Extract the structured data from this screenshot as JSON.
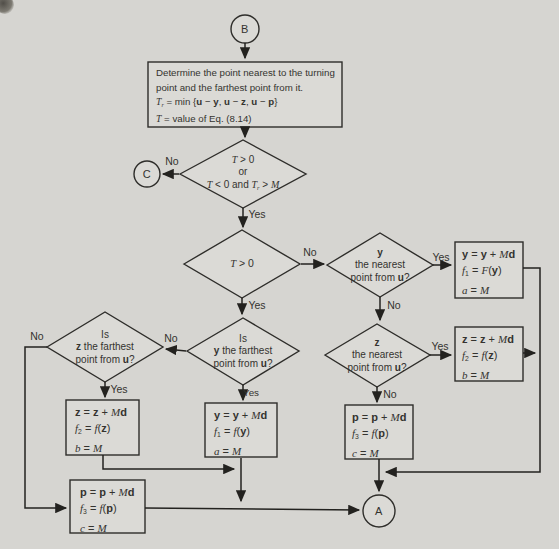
{
  "diagram": {
    "terminals": {
      "b": "B",
      "c": "C",
      "a": "A"
    },
    "labels": {
      "yes": "Yes",
      "no": "No"
    },
    "process": {
      "l1": "Determine the point nearest to the turning",
      "l2": "point and the farthest point from it.",
      "l3": [
        {
          "t": "T",
          "i": true
        },
        {
          "t": "r",
          "i": true,
          "sub": true
        },
        {
          "t": " = min {"
        },
        {
          "t": "u",
          "b": true
        },
        {
          "t": " − "
        },
        {
          "t": "y",
          "b": true
        },
        {
          "t": ", "
        },
        {
          "t": "u",
          "b": true
        },
        {
          "t": " − "
        },
        {
          "t": "z",
          "b": true
        },
        {
          "t": ", "
        },
        {
          "t": "u",
          "b": true
        },
        {
          "t": " − "
        },
        {
          "t": "p",
          "b": true
        },
        {
          "t": "}"
        }
      ],
      "l4": [
        {
          "t": "T",
          "i": true
        },
        {
          "t": " = value of Eq. (8.14)"
        }
      ]
    },
    "decisions": {
      "d1": {
        "l1": [
          {
            "t": "T",
            "i": true
          },
          {
            "t": " > 0"
          }
        ],
        "l2": "or",
        "l3": [
          {
            "t": "T",
            "i": true
          },
          {
            "t": " < 0 and "
          },
          {
            "t": "T",
            "i": true
          },
          {
            "t": "r",
            "i": true,
            "sub": true
          },
          {
            "t": " > "
          },
          {
            "t": "M",
            "i": true
          }
        ]
      },
      "d2": {
        "l1": [
          {
            "t": "T",
            "i": true
          },
          {
            "t": " > 0"
          }
        ]
      },
      "d3": {
        "l1": [
          {
            "t": "y",
            "b": true
          }
        ],
        "l2": "the nearest",
        "l3": [
          {
            "t": "point from "
          },
          {
            "t": "u",
            "b": true
          },
          {
            "t": "?"
          }
        ]
      },
      "d5": {
        "l1": [
          {
            "t": "z",
            "b": true
          }
        ],
        "l2": "the nearest",
        "l3": [
          {
            "t": "point from "
          },
          {
            "t": "u",
            "b": true
          },
          {
            "t": "?"
          }
        ]
      },
      "d4": {
        "l1": "Is",
        "l2": [
          {
            "t": "y",
            "b": true
          },
          {
            "t": " the farthest"
          }
        ],
        "l3": [
          {
            "t": "point from "
          },
          {
            "t": "u",
            "b": true
          },
          {
            "t": "?"
          }
        ]
      },
      "d6": {
        "l1": "Is",
        "l2": [
          {
            "t": "z",
            "b": true
          },
          {
            "t": " the farthest"
          }
        ],
        "l3": [
          {
            "t": "point from "
          },
          {
            "t": "u",
            "b": true
          },
          {
            "t": "?"
          }
        ]
      }
    },
    "boxes": {
      "y_right": {
        "l1": [
          {
            "t": "y",
            "b": true
          },
          {
            "t": " = "
          },
          {
            "t": "y",
            "b": true
          },
          {
            "t": " + "
          },
          {
            "t": "M",
            "i": true
          },
          {
            "t": "d",
            "b": true
          }
        ],
        "l2": [
          {
            "t": "f",
            "i": true
          },
          {
            "t": "1",
            "sub": true
          },
          {
            "t": " = "
          },
          {
            "t": "F",
            "i": true
          },
          {
            "t": "("
          },
          {
            "t": "y",
            "b": true
          },
          {
            "t": ")"
          }
        ],
        "l3": [
          {
            "t": "a",
            "i": true
          },
          {
            "t": " = "
          },
          {
            "t": "M",
            "i": true
          }
        ]
      },
      "z_right": {
        "l1": [
          {
            "t": "z",
            "b": true
          },
          {
            "t": " = "
          },
          {
            "t": "z",
            "b": true
          },
          {
            "t": " + "
          },
          {
            "t": "M",
            "i": true
          },
          {
            "t": "d",
            "b": true
          }
        ],
        "l2": [
          {
            "t": "f",
            "i": true
          },
          {
            "t": "2",
            "sub": true
          },
          {
            "t": " = "
          },
          {
            "t": "f",
            "i": true
          },
          {
            "t": "("
          },
          {
            "t": "z",
            "b": true
          },
          {
            "t": ")"
          }
        ],
        "l3": [
          {
            "t": "b",
            "i": true
          },
          {
            "t": " = "
          },
          {
            "t": "M",
            "i": true
          }
        ]
      },
      "p_right": {
        "l1": [
          {
            "t": "p",
            "b": true
          },
          {
            "t": " = "
          },
          {
            "t": "p",
            "b": true
          },
          {
            "t": " + "
          },
          {
            "t": "M",
            "i": true
          },
          {
            "t": "d",
            "b": true
          }
        ],
        "l2": [
          {
            "t": "f",
            "i": true
          },
          {
            "t": "3",
            "sub": true
          },
          {
            "t": " = "
          },
          {
            "t": "f",
            "i": true
          },
          {
            "t": "("
          },
          {
            "t": "p",
            "b": true
          },
          {
            "t": ")"
          }
        ],
        "l3": [
          {
            "t": "c",
            "i": true
          },
          {
            "t": " = "
          },
          {
            "t": "M",
            "i": true
          }
        ]
      },
      "y_mid": {
        "l1": [
          {
            "t": "y",
            "b": true
          },
          {
            "t": " = "
          },
          {
            "t": "y",
            "b": true
          },
          {
            "t": " + "
          },
          {
            "t": "M",
            "i": true
          },
          {
            "t": "d",
            "b": true
          }
        ],
        "l2": [
          {
            "t": "f",
            "i": true
          },
          {
            "t": "1",
            "sub": true
          },
          {
            "t": " = "
          },
          {
            "t": "f",
            "i": true
          },
          {
            "t": "("
          },
          {
            "t": "y",
            "b": true
          },
          {
            "t": ")"
          }
        ],
        "l3": [
          {
            "t": "a",
            "i": true
          },
          {
            "t": " = "
          },
          {
            "t": "M",
            "i": true
          }
        ]
      },
      "z_left": {
        "l1": [
          {
            "t": "z",
            "b": true
          },
          {
            "t": " = "
          },
          {
            "t": "z",
            "b": true
          },
          {
            "t": " + "
          },
          {
            "t": "M",
            "i": true
          },
          {
            "t": "d",
            "b": true
          }
        ],
        "l2": [
          {
            "t": "f",
            "i": true
          },
          {
            "t": "2",
            "sub": true
          },
          {
            "t": " = "
          },
          {
            "t": "f",
            "i": true
          },
          {
            "t": "("
          },
          {
            "t": "z",
            "b": true
          },
          {
            "t": ")"
          }
        ],
        "l3": [
          {
            "t": "b",
            "i": true
          },
          {
            "t": " = "
          },
          {
            "t": "M",
            "i": true
          }
        ]
      },
      "p_bottom": {
        "l1": [
          {
            "t": "p",
            "b": true
          },
          {
            "t": " = "
          },
          {
            "t": "p",
            "b": true
          },
          {
            "t": " + "
          },
          {
            "t": "M",
            "i": true
          },
          {
            "t": "d",
            "b": true
          }
        ],
        "l2": [
          {
            "t": "f",
            "i": true
          },
          {
            "t": "3",
            "sub": true
          },
          {
            "t": " = "
          },
          {
            "t": "f",
            "i": true
          },
          {
            "t": "("
          },
          {
            "t": "p",
            "b": true
          },
          {
            "t": ")"
          }
        ],
        "l3": [
          {
            "t": "c",
            "i": true
          },
          {
            "t": " = "
          },
          {
            "t": "M",
            "i": true
          }
        ]
      }
    },
    "colors": {
      "background": "#d6d5d1",
      "line": "#2e2d2a",
      "text": "#34332f"
    }
  }
}
